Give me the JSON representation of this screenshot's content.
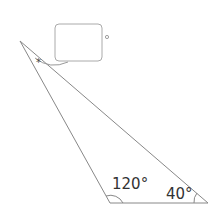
{
  "diagram": {
    "type": "triangle",
    "vertices": {
      "top": {
        "x": 20,
        "y": 41
      },
      "bottom_left": {
        "x": 110,
        "y": 203
      },
      "bottom_right": {
        "x": 208,
        "y": 203
      }
    },
    "angles": {
      "top": {
        "label": "",
        "marker": "*",
        "unknown": true
      },
      "bottom_left": {
        "label": "120°"
      },
      "bottom_right": {
        "label": "40°"
      }
    },
    "answer_box": {
      "value": "",
      "unit_symbol": "°"
    },
    "line_color": "#888888"
  }
}
